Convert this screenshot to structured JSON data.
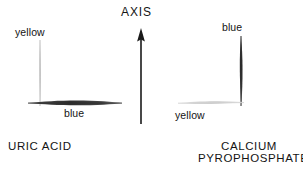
{
  "figure": {
    "background_color": "#ffffff",
    "width": 303,
    "height": 179
  },
  "axis": {
    "label": "AXIS",
    "arrow_direction": "up",
    "color": "#1a1a1a"
  },
  "panels": [
    {
      "id": "uric-acid",
      "caption_lines": [
        "URIC ACID"
      ],
      "vertical_crystal": {
        "orientation": "vertical",
        "label": "yellow",
        "color": "#c9c9c9",
        "intensity": "pale"
      },
      "horizontal_crystal": {
        "orientation": "horizontal",
        "label": "blue",
        "color": "#3a3a3a",
        "intensity": "dark"
      }
    },
    {
      "id": "calcium-pyrophosphate",
      "caption_lines": [
        "CALCIUM",
        "PYROPHOSPHATE"
      ],
      "vertical_crystal": {
        "orientation": "vertical",
        "label": "blue",
        "color": "#3a3a3a",
        "intensity": "dark"
      },
      "horizontal_crystal": {
        "orientation": "horizontal",
        "label": "yellow",
        "color": "#d6d6d6",
        "intensity": "pale"
      }
    }
  ],
  "colors": {
    "ink": "#141414",
    "pale_crystal": "#c9c9c9",
    "dark_crystal": "#3a3a3a",
    "background": "#ffffff"
  }
}
